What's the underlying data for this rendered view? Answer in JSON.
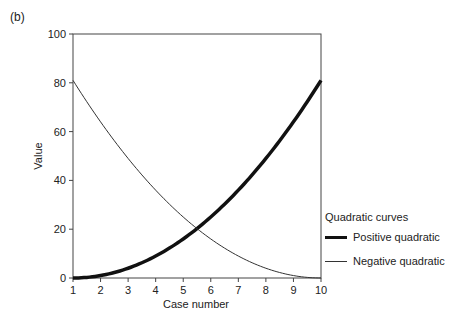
{
  "panel_label": "(b)",
  "chart_data": {
    "type": "line",
    "title": "",
    "xlabel": "Case number",
    "ylabel": "Value",
    "xlim": [
      1,
      10
    ],
    "ylim": [
      0,
      100
    ],
    "x_ticks": [
      1,
      2,
      3,
      4,
      5,
      6,
      7,
      8,
      9,
      10
    ],
    "y_ticks": [
      0,
      20,
      40,
      60,
      80,
      100
    ],
    "grid": false,
    "legend_title": "Quadratic curves",
    "legend_position": "right",
    "x": [
      1,
      2,
      3,
      4,
      5,
      6,
      7,
      8,
      9,
      10
    ],
    "series": [
      {
        "name": "Positive quadratic",
        "values": [
          0,
          1,
          4,
          9,
          16,
          25,
          36,
          49,
          64,
          81
        ],
        "line_width": 3.5,
        "color": "#111111"
      },
      {
        "name": "Negative quadratic",
        "values": [
          81,
          64,
          49,
          36,
          25,
          16,
          9,
          4,
          1,
          0
        ],
        "line_width": 1,
        "color": "#333333"
      }
    ]
  }
}
